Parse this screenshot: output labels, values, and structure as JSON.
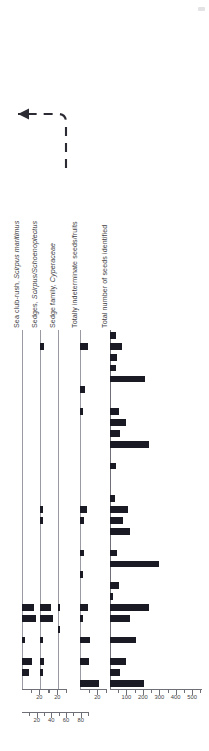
{
  "figure": {
    "kind": "archaeobotanical seed diagram",
    "orientation": "rotated-90",
    "annotation_marker": "dashed-leader-arrow"
  },
  "chart_data": {
    "type": "bar",
    "title": "",
    "xlabel": "",
    "ylabel": "",
    "grid": false,
    "legend": "none",
    "orientation": "horizontal-bars-rotated",
    "categories": [
      "s1",
      "s2",
      "s3",
      "s4",
      "s5",
      "s6",
      "s7",
      "s8",
      "s9",
      "s10",
      "s11",
      "s12",
      "s13",
      "s14",
      "s15",
      "s16",
      "s17",
      "s18",
      "s19",
      "s20",
      "s21",
      "s22",
      "s23",
      "s24",
      "s25",
      "s26",
      "s27",
      "s28",
      "s29",
      "s30",
      "s31",
      "s32",
      "s33"
    ],
    "series": [
      {
        "name": "Sea club-rush, Scirpus maritimus",
        "label_plain": "Sea club-rush, ",
        "label_italic": "Scirpus maritimus",
        "axis_max": 30,
        "axis_ticks": [
          10,
          20,
          30
        ],
        "axis_labeled_ticks": [
          20
        ],
        "axis_label_values": [
          "20"
        ],
        "values": [
          0,
          0,
          0,
          0,
          0,
          0,
          0,
          0,
          0,
          0,
          0,
          0,
          0,
          0,
          0,
          0,
          0,
          0,
          0,
          0,
          0,
          0,
          0,
          0,
          0,
          14,
          16,
          0,
          4,
          0,
          11,
          8,
          0
        ]
      },
      {
        "name": "Sedges, Scirpus/Schoenoplectus",
        "label_plain": "Sedges, ",
        "label_italic": "Scirpus/Schoenoplectus",
        "axis_max": 30,
        "axis_ticks": [
          10,
          20,
          30
        ],
        "axis_labeled_ticks": [
          20
        ],
        "axis_label_values": [
          "20"
        ],
        "values": [
          0,
          5,
          0,
          0,
          0,
          0,
          0,
          0,
          0,
          0,
          0,
          0,
          0,
          0,
          0,
          0,
          4,
          3,
          0,
          0,
          0,
          0,
          0,
          0,
          0,
          13,
          15,
          0,
          3,
          0,
          5,
          4,
          0
        ]
      },
      {
        "name": "Sedge family, Cyperaceae",
        "label_plain": "Sedge family, ",
        "label_italic": "Cyperaceae",
        "axis_max": 90,
        "axis_ticks": [
          10,
          20,
          30,
          40,
          50,
          60,
          70,
          80,
          90
        ],
        "axis_labeled_ticks": [
          20,
          40,
          60,
          80
        ],
        "axis_label_values": [
          "20",
          "40",
          "60",
          "80"
        ],
        "values": [
          0,
          0,
          0,
          0,
          0,
          0,
          0,
          0,
          0,
          0,
          0,
          0,
          0,
          0,
          0,
          0,
          0,
          0,
          0,
          0,
          0,
          0,
          0,
          0,
          0,
          4,
          0,
          2,
          0,
          0,
          0,
          0,
          0
        ]
      },
      {
        "name": "Totally indeterminate seeds/fruits",
        "label_plain": "Totally indeterminate seeds/fruits",
        "label_italic": "",
        "axis_max": 30,
        "axis_ticks": [
          10,
          20,
          30
        ],
        "axis_labeled_ticks": [
          20
        ],
        "axis_label_values": [
          "20"
        ],
        "values": [
          0,
          9,
          0,
          0,
          0,
          6,
          0,
          4,
          0,
          0,
          0,
          0,
          0,
          0,
          0,
          0,
          8,
          5,
          0,
          0,
          5,
          0,
          3,
          0,
          0,
          9,
          4,
          0,
          12,
          0,
          10,
          0,
          22
        ]
      },
      {
        "name": "Total number of seeds identified",
        "label_plain": "Total number of seeds identified",
        "label_italic": "",
        "axis_max": 560,
        "axis_ticks": [
          50,
          100,
          150,
          200,
          250,
          300,
          350,
          400,
          450,
          500,
          550
        ],
        "axis_labeled_ticks": [
          100,
          200,
          300,
          400,
          500
        ],
        "axis_label_values": [
          "100",
          "200",
          "300",
          "400",
          "500"
        ],
        "values": [
          35,
          70,
          40,
          38,
          210,
          0,
          0,
          55,
          95,
          60,
          240,
          0,
          35,
          0,
          0,
          30,
          110,
          80,
          120,
          0,
          45,
          300,
          0,
          55,
          20,
          240,
          120,
          0,
          160,
          0,
          95,
          60,
          205
        ]
      }
    ]
  },
  "axes_groups": [
    {
      "name": "scale-scirpus-maritimus",
      "max": 30,
      "labels": [
        "20"
      ]
    },
    {
      "name": "scale-sedges",
      "max": 30,
      "labels": [
        "20"
      ]
    },
    {
      "name": "scale-cyperaceae",
      "max": 90,
      "labels": [
        "20",
        "40",
        "60",
        "80"
      ]
    },
    {
      "name": "scale-indeterminate",
      "max": 30,
      "labels": [
        "20"
      ]
    },
    {
      "name": "scale-total-seeds",
      "max": 560,
      "labels": [
        "100",
        "200",
        "300",
        "400",
        "500"
      ]
    }
  ],
  "colors": {
    "bar": "#1a1a24",
    "axis": "#6f6f77",
    "text": "#3f3f46",
    "background": "#ffffff"
  }
}
